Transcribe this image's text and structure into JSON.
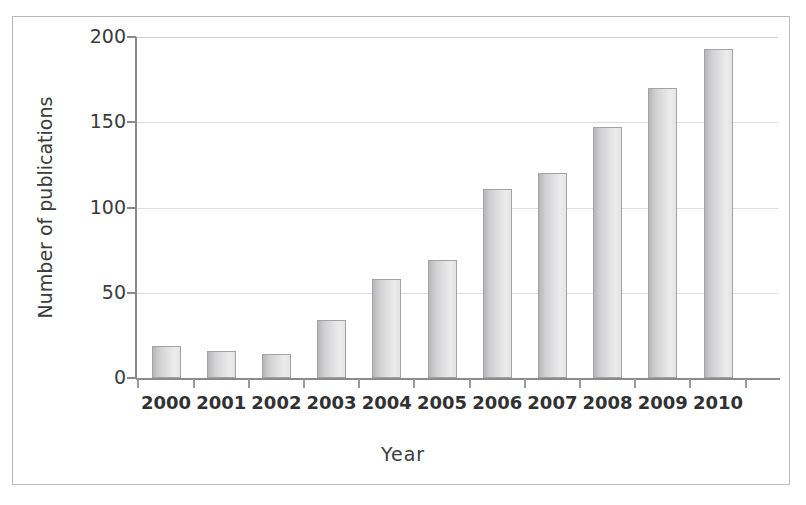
{
  "chart_data": {
    "type": "bar",
    "title": "",
    "xlabel": "Year",
    "ylabel": "Number of publications",
    "categories": [
      "2000",
      "2001",
      "2002",
      "2003",
      "2004",
      "2005",
      "2006",
      "2007",
      "2008",
      "2009",
      "2010"
    ],
    "values": [
      19,
      16,
      14,
      34,
      58,
      69,
      111,
      120,
      147,
      170,
      193
    ],
    "series": [
      {
        "name": "Number of publications",
        "values": [
          19,
          16,
          14,
          34,
          58,
          69,
          111,
          120,
          147,
          170,
          193
        ]
      }
    ],
    "ylim": [
      0,
      200
    ],
    "ytick_labels": [
      "0",
      "50",
      "100",
      "150",
      "200"
    ],
    "ytick_values": [
      0,
      50,
      100,
      150,
      200
    ],
    "grid": "horizontal",
    "legend_position": "none",
    "bar_fill_color": "#d9d9da",
    "bar_edge_color": "#a3a3a6",
    "gridline_color": "#dededf",
    "axis_color": "#8a8a8c",
    "text_color": "#3b3b3d",
    "background_color": "#ffffff"
  },
  "axes": {
    "y": {
      "title": "Number of publications",
      "ticks": [
        {
          "label": "200",
          "value": 200
        },
        {
          "label": "150",
          "value": 150
        },
        {
          "label": "100",
          "value": 100
        },
        {
          "label": "50",
          "value": 50
        },
        {
          "label": "0",
          "value": 0
        }
      ]
    },
    "x": {
      "title": "Year",
      "ticks": [
        {
          "label": "2000"
        },
        {
          "label": "2001"
        },
        {
          "label": "2002"
        },
        {
          "label": "2003"
        },
        {
          "label": "2004"
        },
        {
          "label": "2005"
        },
        {
          "label": "2006"
        },
        {
          "label": "2007"
        },
        {
          "label": "2008"
        },
        {
          "label": "2009"
        },
        {
          "label": "2010"
        }
      ]
    }
  }
}
